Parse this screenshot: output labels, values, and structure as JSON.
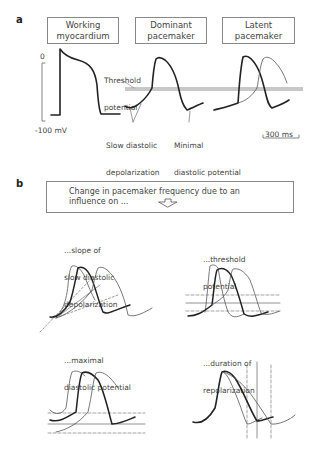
{
  "panel_a": {
    "letter": "a",
    "boxes": [
      "Working\nmyocardium",
      "Dominant\npacemaker",
      "Latent\npacemaker"
    ],
    "box_lines": [
      [
        "Working",
        "myocardium"
      ],
      [
        "Dominant",
        "pacemaker"
      ],
      [
        "Latent",
        "pacemaker"
      ]
    ],
    "y_top_label": "0",
    "y_bottom_label": "-100 mV",
    "threshold_label": [
      "Threshold",
      "potential"
    ],
    "slow_diastolic_label": [
      "Slow diastolic",
      "depolarization"
    ],
    "minimal_diastolic_label": [
      "Minimal",
      "diastolic potential"
    ],
    "scale_bar_label": "300 ms"
  },
  "panel_b": {
    "letter": "b",
    "header_lines": [
      "Change in pacemaker frequency due to an",
      "influence on ..."
    ],
    "subplots": [
      {
        "title_lines": [
          "...slope of",
          "slow diastolic",
          "depolarization"
        ]
      },
      {
        "title_lines": [
          "...threshold",
          "potential"
        ]
      },
      {
        "title_lines": [
          "...maximal",
          "diastolic potential"
        ]
      },
      {
        "title_lines": [
          "...duration of",
          "repolarization"
        ]
      }
    ]
  },
  "colors": {
    "thick_line": "#222222",
    "thin_line": "#555555",
    "threshold_band": "#c8c8c8",
    "box_border": "#888888",
    "text": "#444444"
  }
}
